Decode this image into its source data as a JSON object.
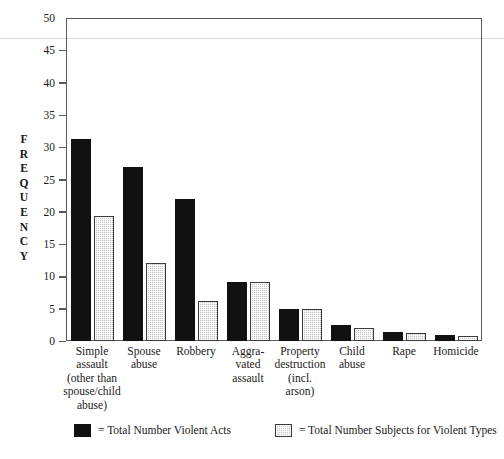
{
  "chart_data": {
    "type": "bar",
    "title": "",
    "xlabel": "",
    "ylabel": "FREQUENCY",
    "ylim": [
      0,
      50
    ],
    "yticks": [
      0,
      5,
      10,
      15,
      20,
      25,
      30,
      35,
      40,
      45,
      50
    ],
    "grid": false,
    "legend_position": "bottom",
    "categories": [
      "Simple\nassault\n(other than\nspouse/child\nabuse)",
      "Spouse\nabuse",
      "Robbery",
      "Aggra-\nvated\nassault",
      "Property\ndestruction\n(incl.\narson)",
      "Child\nabuse",
      "Rape",
      "Homicide"
    ],
    "series": [
      {
        "name": "= Total Number Violent Acts",
        "color": "#111111",
        "values": [
          31.3,
          27.0,
          22.0,
          9.2,
          5.0,
          2.5,
          1.4,
          1.0
        ]
      },
      {
        "name": "= Total Number Subjects for Violent Types",
        "color": "#c3c3c3",
        "values": [
          19.4,
          12.0,
          6.2,
          9.2,
          5.0,
          2.0,
          1.3,
          0.8
        ]
      }
    ]
  },
  "axis": {
    "y_title_letters": [
      "F",
      "R",
      "E",
      "Q",
      "U",
      "E",
      "N",
      "C",
      "Y"
    ]
  },
  "legend": {
    "items": [
      {
        "label": "= Total Number Violent Acts",
        "swatch": "dark"
      },
      {
        "label": "= Total Number Subjects for Violent Types",
        "swatch": "light"
      }
    ]
  }
}
